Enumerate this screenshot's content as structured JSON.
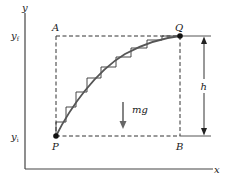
{
  "diagram": {
    "axes": {
      "x_label": "x",
      "y_label": "y",
      "y_final_label": "y_f",
      "y_final_text": "y",
      "y_final_sub": "f",
      "y_initial_text": "y",
      "y_initial_sub": "i"
    },
    "points": {
      "A": "A",
      "B": "B",
      "P": "P",
      "Q": "Q"
    },
    "force_label": "mg",
    "height_label": "h",
    "colors": {
      "line": "#1a1a1a",
      "curve": "#555555",
      "force_arrow": "#666666",
      "dashed": "#333333"
    }
  }
}
